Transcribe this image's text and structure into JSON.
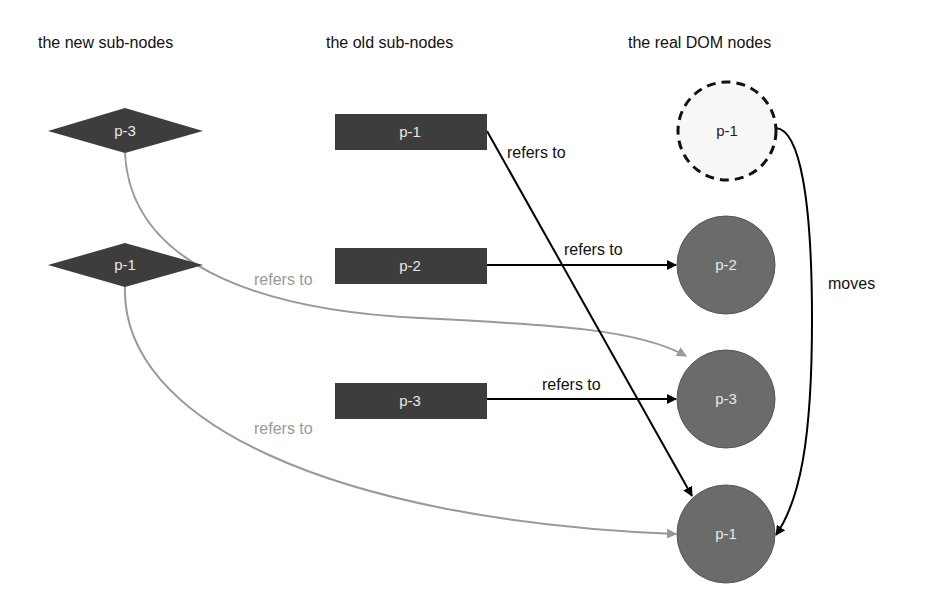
{
  "headers": {
    "new": "the new sub-nodes",
    "old": "the old sub-nodes",
    "dom": "the real DOM nodes"
  },
  "new_nodes": [
    {
      "label": "p-3"
    },
    {
      "label": "p-1"
    }
  ],
  "old_nodes": [
    {
      "label": "p-1"
    },
    {
      "label": "p-2"
    },
    {
      "label": "p-3"
    }
  ],
  "dom_nodes": [
    {
      "label": "p-1",
      "state": "removed-dashed"
    },
    {
      "label": "p-2"
    },
    {
      "label": "p-3"
    },
    {
      "label": "p-1"
    }
  ],
  "edge_labels": {
    "old_p1": "refers to",
    "old_p2": "refers to",
    "old_p3": "refers to",
    "new_p3": "refers to",
    "new_p1": "refers to",
    "move": "moves"
  },
  "colors": {
    "node_fill": "#3d3d3d",
    "circle_fill": "#6b6b6b",
    "gray_edge": "#999999",
    "black_edge": "#000000"
  }
}
